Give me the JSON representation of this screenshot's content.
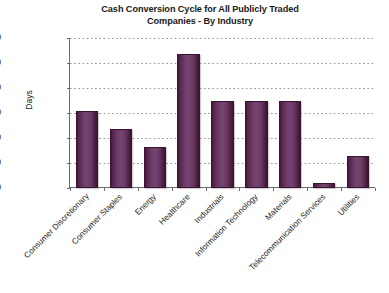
{
  "chart_data": {
    "type": "bar",
    "title": "Cash Conversion Cycle for All Publicly Traded Companies - By Industry",
    "title_lines": [
      "Cash Conversion Cycle for All Publicly Traded",
      "Companies - By Industry"
    ],
    "xlabel": "",
    "ylabel": "Days",
    "ylim": [
      0,
      120
    ],
    "ytick_labels": [
      "120",
      "100",
      "80",
      "60",
      "40",
      "20",
      "0"
    ],
    "yticks": [
      120,
      100,
      80,
      60,
      40,
      20,
      0
    ],
    "grid": true,
    "grid_style": "dotted-horizontal",
    "legend": "none",
    "categories": [
      "Consumer Discretionary",
      "Consumer Staples",
      "Energy",
      "Healthcare",
      "Industrials",
      "Information Technology",
      "Materials",
      "Telecommunication Services",
      "Utilities"
    ],
    "values": [
      62,
      47,
      33,
      107,
      70,
      70,
      70,
      4,
      26
    ],
    "bar_color_dark": "#3a1430",
    "bar_color_light": "#744472",
    "axis_color": "#6d6d6d",
    "grid_color": "#9a9a9a",
    "background": "#ffffff"
  }
}
